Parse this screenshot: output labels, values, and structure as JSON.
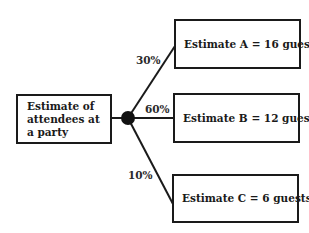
{
  "diagram": {
    "type": "probability-tree",
    "root": {
      "label": "Estimate of attendees at a party"
    },
    "chance_node": {
      "shape": "filled-circle",
      "color": "#111111"
    },
    "branches": [
      {
        "probability": "30%",
        "outcome": "Estimate A = 16 guests"
      },
      {
        "probability": "60%",
        "outcome": "Estimate B = 12 guests"
      },
      {
        "probability": "10%",
        "outcome": "Estimate C = 6 guests"
      }
    ],
    "colors": {
      "line": "#1a1a1a",
      "background": "#ffffff",
      "text": "#1a1a1a"
    }
  }
}
